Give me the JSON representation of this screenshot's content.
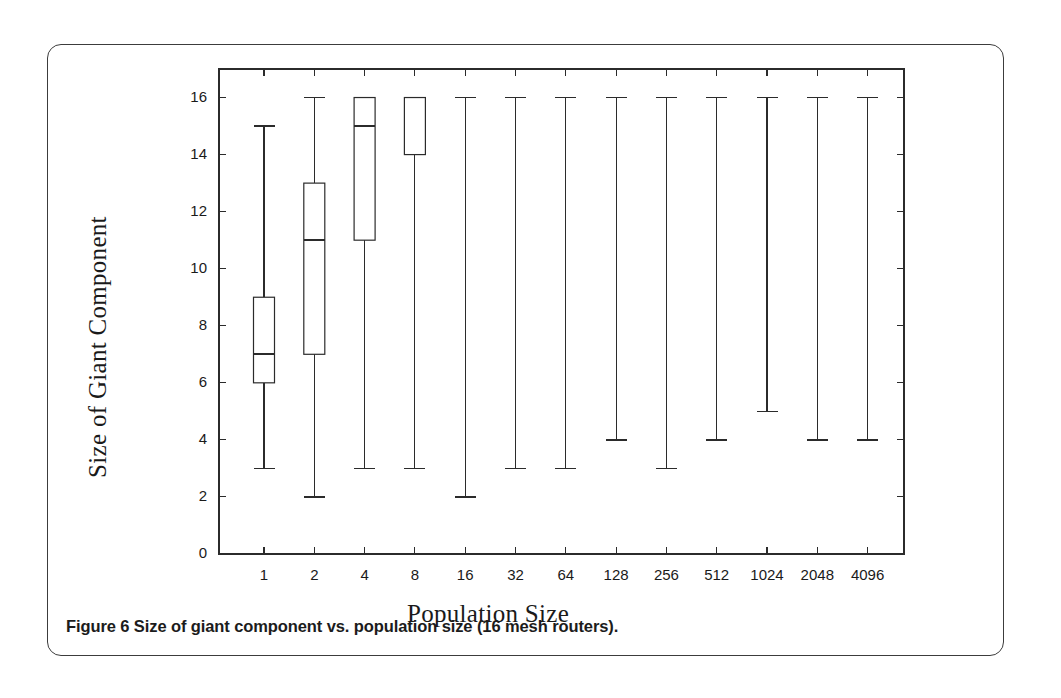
{
  "figure": {
    "caption": "Figure 6 Size of giant component vs. population size (16 mesh routers)."
  },
  "chart_data": {
    "type": "box",
    "title": "",
    "xlabel": "Population Size",
    "ylabel": "Size of Giant Component",
    "categories": [
      "1",
      "2",
      "4",
      "8",
      "16",
      "32",
      "64",
      "128",
      "256",
      "512",
      "1024",
      "2048",
      "4096"
    ],
    "ylim": [
      0,
      17
    ],
    "yticks": [
      0,
      2,
      4,
      6,
      8,
      10,
      12,
      14,
      16
    ],
    "ytick_labels": [
      "0",
      "2",
      "4",
      "6",
      "8",
      "10",
      "12",
      "14",
      "16"
    ],
    "grid": false,
    "legend": null,
    "line_color": "#2b2b2b",
    "box_fill": "#ffffff",
    "boxes": [
      {
        "category": "1",
        "whisker_low": 3,
        "q1": 6,
        "median": 7,
        "q3": 9,
        "whisker_high": 15
      },
      {
        "category": "2",
        "whisker_low": 2,
        "q1": 7,
        "median": 11,
        "q3": 13,
        "whisker_high": 16
      },
      {
        "category": "4",
        "whisker_low": 3,
        "q1": 11,
        "median": 15,
        "q3": 16,
        "whisker_high": 16
      },
      {
        "category": "8",
        "whisker_low": 3,
        "q1": 14,
        "median": 16,
        "q3": 16,
        "whisker_high": 16
      },
      {
        "category": "16",
        "whisker_low": 2,
        "q1": 16,
        "median": 16,
        "q3": 16,
        "whisker_high": 16
      },
      {
        "category": "32",
        "whisker_low": 3,
        "q1": 16,
        "median": 16,
        "q3": 16,
        "whisker_high": 16
      },
      {
        "category": "64",
        "whisker_low": 3,
        "q1": 16,
        "median": 16,
        "q3": 16,
        "whisker_high": 16
      },
      {
        "category": "128",
        "whisker_low": 4,
        "q1": 16,
        "median": 16,
        "q3": 16,
        "whisker_high": 16
      },
      {
        "category": "256",
        "whisker_low": 3,
        "q1": 16,
        "median": 16,
        "q3": 16,
        "whisker_high": 16
      },
      {
        "category": "512",
        "whisker_low": 4,
        "q1": 16,
        "median": 16,
        "q3": 16,
        "whisker_high": 16
      },
      {
        "category": "1024",
        "whisker_low": 5,
        "q1": 16,
        "median": 16,
        "q3": 16,
        "whisker_high": 16
      },
      {
        "category": "2048",
        "whisker_low": 4,
        "q1": 16,
        "median": 16,
        "q3": 16,
        "whisker_high": 16
      },
      {
        "category": "4096",
        "whisker_low": 4,
        "q1": 16,
        "median": 16,
        "q3": 16,
        "whisker_high": 16
      }
    ]
  }
}
